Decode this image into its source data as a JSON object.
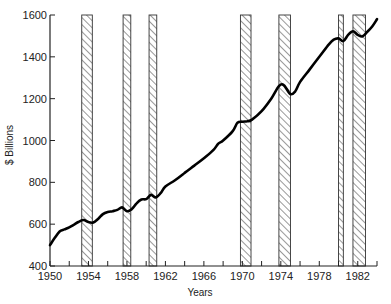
{
  "chart_data": {
    "type": "line",
    "title": "",
    "xlabel": "Years",
    "ylabel": "$ Billions",
    "xlim": [
      1950,
      1984
    ],
    "ylim": [
      400,
      1600
    ],
    "x_ticks": [
      1950,
      1954,
      1958,
      1962,
      1966,
      1970,
      1974,
      1978,
      1982
    ],
    "x_minor_ticks": [
      1952,
      1956,
      1960,
      1964,
      1968,
      1972,
      1976,
      1980,
      1984
    ],
    "y_ticks": [
      400,
      600,
      800,
      1000,
      1200,
      1400,
      1600
    ],
    "grid": false,
    "legend": null,
    "series": [
      {
        "name": "Real GNP ($ Billions)",
        "x": [
          1950,
          1950.5,
          1951,
          1951.5,
          1952,
          1952.5,
          1953,
          1953.5,
          1954,
          1954.5,
          1955,
          1955.5,
          1956,
          1956.5,
          1957,
          1957.5,
          1958,
          1958.5,
          1959,
          1959.5,
          1960,
          1960.5,
          1961,
          1961.5,
          1962,
          1963,
          1964,
          1965,
          1966,
          1967,
          1967.5,
          1968,
          1969,
          1969.5,
          1970,
          1970.5,
          1971,
          1972,
          1973,
          1973.8,
          1974.3,
          1975,
          1975.5,
          1976,
          1977,
          1978,
          1979,
          1979.5,
          1980,
          1980.5,
          1981,
          1981.5,
          1982,
          1982.5,
          1983,
          1983.5,
          1984
        ],
        "values": [
          500,
          535,
          565,
          575,
          585,
          598,
          612,
          620,
          610,
          608,
          625,
          648,
          658,
          662,
          668,
          680,
          662,
          672,
          700,
          718,
          720,
          740,
          728,
          748,
          780,
          810,
          845,
          880,
          915,
          955,
          985,
          1000,
          1045,
          1085,
          1090,
          1092,
          1100,
          1140,
          1200,
          1260,
          1265,
          1222,
          1235,
          1280,
          1340,
          1400,
          1460,
          1482,
          1488,
          1475,
          1505,
          1522,
          1505,
          1498,
          1520,
          1545,
          1580
        ]
      }
    ],
    "shaded_periods": [
      {
        "label": "recession",
        "start": 1953.3,
        "end": 1954.4
      },
      {
        "label": "recession",
        "start": 1957.6,
        "end": 1958.4
      },
      {
        "label": "recession",
        "start": 1960.3,
        "end": 1961.1
      },
      {
        "label": "recession",
        "start": 1969.8,
        "end": 1970.9
      },
      {
        "label": "recession",
        "start": 1973.8,
        "end": 1975.0
      },
      {
        "label": "recession",
        "start": 1980.0,
        "end": 1980.5
      },
      {
        "label": "recession",
        "start": 1981.5,
        "end": 1982.8
      }
    ],
    "annotations": [
      "Shaded bands indicate recessions"
    ]
  },
  "labels": {
    "y_axis_title": "$ Billions",
    "x_axis_title": "Years"
  }
}
